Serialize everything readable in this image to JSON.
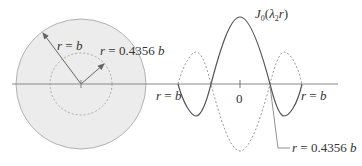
{
  "left_figure": {
    "outer_label": "r = b",
    "inner_label": "r = 0.4356 b",
    "outer_fill": "#ebebeb",
    "outer_stroke": "#9a9a9a"
  },
  "right_figure": {
    "function_label_main": "J",
    "function_label_sub": "0",
    "function_label_arg": "(λ",
    "function_label_arg_sub": "2",
    "function_label_tail": "r)",
    "left_end_label": "r = b",
    "right_end_label": "r = b",
    "origin_label": "0",
    "node_label": "r = 0.4356 b"
  },
  "colors": {
    "axis": "#888888",
    "solid_curve": "#555555",
    "dashed_curve": "#999999",
    "arrow": "#666666"
  }
}
